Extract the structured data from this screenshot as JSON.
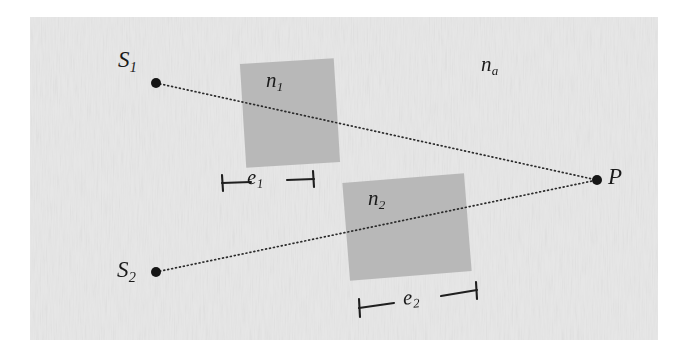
{
  "figure": {
    "background_color": "#ececec",
    "paper_border_color": "#ffffff",
    "ink_color": "#1a1a1a",
    "slab_fill_color": "#b4b4b4",
    "canvas": {
      "width": 688,
      "height": 363
    },
    "paper_area": {
      "x": 30,
      "y": 17,
      "width": 628,
      "height": 323
    }
  },
  "labels": {
    "source_1": {
      "base": "S",
      "sub": "1"
    },
    "source_2": {
      "base": "S",
      "sub": "2"
    },
    "point_p": {
      "base": "P",
      "sub": ""
    },
    "index_1": {
      "base": "n",
      "sub": "1"
    },
    "index_2": {
      "base": "n",
      "sub": "2"
    },
    "index_ambient": {
      "base": "n",
      "sub": "a"
    },
    "thickness_1": {
      "base": "e",
      "sub": "1"
    },
    "thickness_2": {
      "base": "e",
      "sub": "2"
    }
  },
  "points": {
    "s1": {
      "x": 156,
      "y": 83,
      "radius": 5
    },
    "s2": {
      "x": 156,
      "y": 272,
      "radius": 5
    },
    "p": {
      "x": 597,
      "y": 180,
      "radius": 5
    }
  },
  "rays": [
    {
      "name": "ray-s1-to-p",
      "from": "s1",
      "to": "p",
      "style": "dotted"
    },
    {
      "name": "ray-s2-to-p",
      "from": "s2",
      "to": "p",
      "style": "dotted"
    }
  ],
  "slabs": [
    {
      "name": "slab-n1",
      "label": "n1",
      "center_x": 290,
      "center_y": 113,
      "width": 94,
      "height": 104,
      "rotation_deg": -3.5
    },
    {
      "name": "slab-n2",
      "label": "n2",
      "center_x": 407,
      "center_y": 227,
      "width": 122,
      "height": 98,
      "rotation_deg": -4.5
    }
  ],
  "dimension_brackets": [
    {
      "name": "bracket-e1",
      "label": "e1",
      "x1": 222,
      "y1": 183,
      "x2": 314,
      "y2": 179,
      "tick_half_height": 8
    },
    {
      "name": "bracket-e2",
      "label": "e2",
      "x1": 359,
      "y1": 308,
      "x2": 477,
      "y2": 290,
      "tick_half_height": 9
    }
  ]
}
